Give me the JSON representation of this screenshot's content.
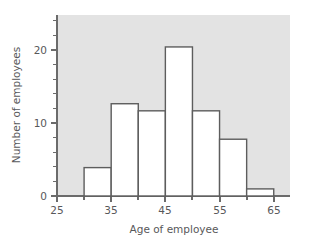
{
  "chart_data": {
    "type": "bar",
    "title": "",
    "subtitle": "",
    "xlabel": "Age of employee",
    "ylabel": "Number of employees",
    "categories": [
      "30-35",
      "35-40",
      "40-45",
      "45-50",
      "50-55",
      "55-60",
      "60-65"
    ],
    "bin_edges": [
      30,
      35,
      40,
      45,
      50,
      55,
      60,
      65
    ],
    "values": [
      4,
      13,
      12,
      21,
      12,
      8,
      1
    ],
    "xlim": [
      25,
      68
    ],
    "ylim": [
      0,
      25.5
    ],
    "x_tick_labels": [
      "25",
      "35",
      "45",
      "55",
      "65"
    ],
    "x_tick_values": [
      25,
      35,
      45,
      55,
      65
    ],
    "x_minor_tick_values": [
      30,
      40,
      50,
      60
    ],
    "y_tick_labels": [
      "0",
      "10",
      "20"
    ],
    "y_tick_values": [
      0,
      10,
      20
    ],
    "y_minor_tick_values": [
      2,
      4,
      6,
      8,
      12,
      14,
      16,
      18,
      22,
      24
    ],
    "grid": false,
    "legend": null,
    "plot_background_color": "#e3e3e3",
    "bar_fill_color": "#ffffff",
    "bar_edge_color": "#5d5d5d",
    "axis_color": "#6b6b6b",
    "text_color": "#58585a"
  }
}
